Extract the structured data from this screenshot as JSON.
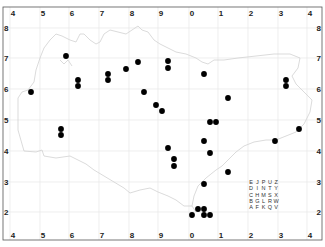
{
  "map": {
    "title": "",
    "x_ticks_top": [
      {
        "label": "4",
        "x": 10
      },
      {
        "label": "5",
        "x": 40
      },
      {
        "label": "6",
        "x": 69
      },
      {
        "label": "7",
        "x": 99
      },
      {
        "label": "8",
        "x": 129
      },
      {
        "label": "9",
        "x": 158
      },
      {
        "label": "0",
        "x": 189
      },
      {
        "label": "1",
        "x": 218
      },
      {
        "label": "2",
        "x": 248
      },
      {
        "label": "3",
        "x": 278
      },
      {
        "label": "4",
        "x": 307
      }
    ],
    "x_ticks_bottom": [
      {
        "label": "4",
        "x": 10
      },
      {
        "label": "5",
        "x": 40
      },
      {
        "label": "6",
        "x": 69
      },
      {
        "label": "7",
        "x": 99
      },
      {
        "label": "8",
        "x": 129
      },
      {
        "label": "9",
        "x": 158
      },
      {
        "label": "0",
        "x": 189
      },
      {
        "label": "1",
        "x": 218
      },
      {
        "label": "2",
        "x": 248
      },
      {
        "label": "3",
        "x": 278
      },
      {
        "label": "4",
        "x": 307
      }
    ],
    "y_ticks_left": [
      {
        "label": "8",
        "y": 28
      },
      {
        "label": "7",
        "y": 58
      },
      {
        "label": "6",
        "y": 89
      },
      {
        "label": "5",
        "y": 120
      },
      {
        "label": "4",
        "y": 151
      },
      {
        "label": "3",
        "y": 182
      },
      {
        "label": "2",
        "y": 212
      }
    ],
    "y_ticks_right": [
      {
        "label": "8",
        "y": 28
      },
      {
        "label": "7",
        "y": 58
      },
      {
        "label": "6",
        "y": 89
      },
      {
        "label": "5",
        "y": 120
      },
      {
        "label": "4",
        "y": 151
      },
      {
        "label": "3",
        "y": 182
      },
      {
        "label": "2",
        "y": 212
      }
    ],
    "grid_color": "#e6e6e6",
    "coast_color": "#d0d0d0",
    "dot_color": "#000000",
    "points": [
      {
        "x": 31,
        "y": 92
      },
      {
        "x": 66,
        "y": 56
      },
      {
        "x": 78,
        "y": 80
      },
      {
        "x": 78,
        "y": 86
      },
      {
        "x": 108,
        "y": 74
      },
      {
        "x": 108,
        "y": 80
      },
      {
        "x": 126,
        "y": 69
      },
      {
        "x": 138,
        "y": 62
      },
      {
        "x": 144,
        "y": 92
      },
      {
        "x": 156,
        "y": 105
      },
      {
        "x": 162,
        "y": 111
      },
      {
        "x": 168,
        "y": 61
      },
      {
        "x": 168,
        "y": 68
      },
      {
        "x": 204,
        "y": 74
      },
      {
        "x": 286,
        "y": 80
      },
      {
        "x": 286,
        "y": 86
      },
      {
        "x": 228,
        "y": 98
      },
      {
        "x": 210,
        "y": 122
      },
      {
        "x": 216,
        "y": 122
      },
      {
        "x": 204,
        "y": 141
      },
      {
        "x": 210,
        "y": 153
      },
      {
        "x": 168,
        "y": 148
      },
      {
        "x": 174,
        "y": 159
      },
      {
        "x": 174,
        "y": 166
      },
      {
        "x": 228,
        "y": 172
      },
      {
        "x": 204,
        "y": 184
      },
      {
        "x": 198,
        "y": 209
      },
      {
        "x": 204,
        "y": 209
      },
      {
        "x": 192,
        "y": 215
      },
      {
        "x": 204,
        "y": 215
      },
      {
        "x": 210,
        "y": 215
      },
      {
        "x": 275,
        "y": 141
      },
      {
        "x": 299,
        "y": 129
      },
      {
        "x": 61,
        "y": 129
      },
      {
        "x": 61,
        "y": 135
      }
    ],
    "key_grid": [
      [
        "E",
        "J",
        "P",
        "U",
        "Z"
      ],
      [
        "D",
        "I",
        "N",
        "T",
        "Y"
      ],
      [
        "C",
        "H",
        "M",
        "S",
        "X"
      ],
      [
        "B",
        "G",
        "L",
        "R",
        "W"
      ],
      [
        "A",
        "F",
        "K",
        "Q",
        "V"
      ]
    ]
  }
}
